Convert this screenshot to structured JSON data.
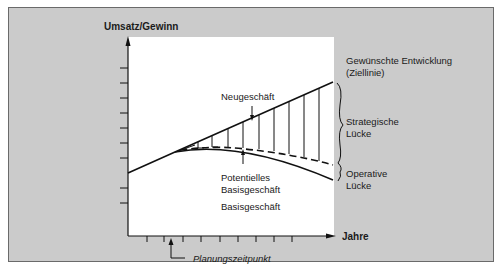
{
  "diagram": {
    "y_axis_label": "Umsatz/Gewinn",
    "x_axis_label": "Jahre",
    "labels": {
      "target_line": "Gewünschte Entwicklung",
      "target_line_sub": "(Ziellinie)",
      "strategic_gap_1": "Strategische",
      "strategic_gap_2": "Lücke",
      "operative_gap_1": "Operative",
      "operative_gap_2": "Lücke",
      "new_business": "Neugeschäft",
      "potential_base_1": "Potentielles",
      "potential_base_2": "Basisgeschäft",
      "base_business": "Basisgeschäft",
      "planning_point": "Planungszeitpunkt"
    },
    "colors": {
      "background": "#cbcbcb",
      "plot_area": "#ffffff",
      "line": "#111111"
    }
  }
}
